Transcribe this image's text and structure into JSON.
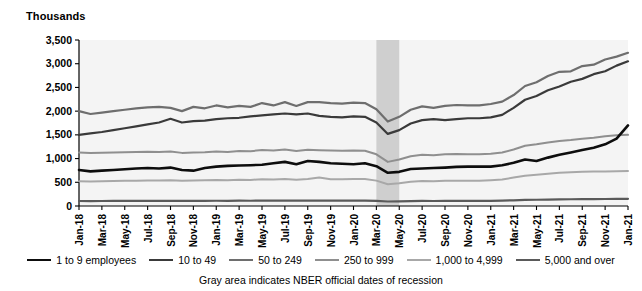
{
  "axis_title": "Thousands",
  "footnote": "Gray area indicates NBER official dates of recession",
  "legend": {
    "items": [
      {
        "label": "1 to 9 employees",
        "color": "#0d0d0d",
        "width": 2.6
      },
      {
        "label": "10 to 49",
        "color": "#3a3a3a",
        "width": 2.2
      },
      {
        "label": "50 to 249",
        "color": "#6e6e6e",
        "width": 2.2
      },
      {
        "label": "250 to 999",
        "color": "#8f8f8f",
        "width": 2.0
      },
      {
        "label": "1,000 to 4,999",
        "color": "#a8a8a8",
        "width": 2.0
      },
      {
        "label": "5,000 and over",
        "color": "#5a5a5a",
        "width": 2.2
      }
    ]
  },
  "chart_data": {
    "type": "line",
    "title": "",
    "xlabel": "",
    "ylabel": "Thousands",
    "ylim": [
      0,
      3500
    ],
    "ytick_step": 500,
    "yticks": [
      0,
      500,
      1000,
      1500,
      2000,
      2500,
      3000,
      3500
    ],
    "ytick_labels": [
      "0",
      "500",
      "1,000",
      "1,500",
      "2,000",
      "2,500",
      "3,000",
      "3,500"
    ],
    "grid": false,
    "legend_position": "bottom",
    "x": [
      "Jan-18",
      "Feb-18",
      "Mar-18",
      "Apr-18",
      "May-18",
      "Jun-18",
      "Jul-18",
      "Aug-18",
      "Sep-18",
      "Oct-18",
      "Nov-18",
      "Dec-18",
      "Jan-19",
      "Feb-19",
      "Mar-19",
      "Apr-19",
      "May-19",
      "Jun-19",
      "Jul-19",
      "Aug-19",
      "Sep-19",
      "Oct-19",
      "Nov-19",
      "Dec-19",
      "Jan-20",
      "Feb-20",
      "Mar-20",
      "Apr-20",
      "May-20",
      "Jun-20",
      "Jul-20",
      "Aug-20",
      "Sep-20",
      "Oct-20",
      "Nov-20",
      "Dec-20",
      "Jan-21",
      "Feb-21",
      "Mar-21",
      "Apr-21",
      "May-21",
      "Jun-21",
      "Jul-21",
      "Aug-21",
      "Sep-21",
      "Oct-21",
      "Nov-21",
      "Dec-21",
      "Jan-22"
    ],
    "xtick_labels": [
      "Jan-18",
      "Mar-18",
      "May-18",
      "Jul-18",
      "Sep-18",
      "Nov-18",
      "Jan-19",
      "Mar-19",
      "May-19",
      "Jul-19",
      "Sep-19",
      "Nov-19",
      "Jan-20",
      "Mar-20",
      "May-20",
      "Jul-20",
      "Sep-20",
      "Nov-20",
      "Jan-21",
      "Mar-21",
      "May-21",
      "Jul-21",
      "Sep-21",
      "Nov-21",
      "Jan-21"
    ],
    "xtick_indices": [
      0,
      2,
      4,
      6,
      8,
      10,
      12,
      14,
      16,
      18,
      20,
      22,
      24,
      26,
      28,
      30,
      32,
      34,
      36,
      38,
      40,
      42,
      44,
      46,
      48
    ],
    "shaded_region": {
      "label": "NBER official dates of recession",
      "from": "Mar-20",
      "to": "May-20",
      "from_index": 26,
      "to_index": 28,
      "color": "#cfcfcf"
    },
    "series": [
      {
        "name": "1 to 9 employees",
        "color": "#0d0d0d",
        "width": 2.6,
        "values": [
          760,
          730,
          745,
          760,
          775,
          790,
          800,
          790,
          810,
          760,
          745,
          800,
          830,
          845,
          855,
          860,
          870,
          900,
          930,
          880,
          950,
          930,
          900,
          890,
          880,
          900,
          840,
          700,
          720,
          780,
          790,
          800,
          810,
          825,
          830,
          830,
          830,
          860,
          910,
          980,
          950,
          1020,
          1080,
          1130,
          1180,
          1230,
          1300,
          1420,
          1700
        ]
      },
      {
        "name": "10 to 49",
        "color": "#3a3a3a",
        "width": 2.2,
        "values": [
          1500,
          1530,
          1560,
          1600,
          1640,
          1680,
          1720,
          1760,
          1840,
          1760,
          1790,
          1800,
          1830,
          1850,
          1860,
          1890,
          1910,
          1930,
          1950,
          1930,
          1950,
          1900,
          1880,
          1870,
          1890,
          1880,
          1760,
          1520,
          1600,
          1740,
          1810,
          1830,
          1810,
          1830,
          1850,
          1850,
          1870,
          1920,
          2070,
          2240,
          2320,
          2440,
          2520,
          2620,
          2680,
          2780,
          2840,
          2960,
          3050
        ]
      },
      {
        "name": "50 to 249",
        "color": "#6e6e6e",
        "width": 2.2,
        "values": [
          2000,
          1940,
          1970,
          2000,
          2030,
          2060,
          2080,
          2090,
          2070,
          2000,
          2090,
          2060,
          2120,
          2080,
          2110,
          2090,
          2170,
          2120,
          2190,
          2110,
          2190,
          2190,
          2170,
          2160,
          2180,
          2170,
          2040,
          1780,
          1880,
          2030,
          2100,
          2070,
          2110,
          2130,
          2120,
          2120,
          2150,
          2200,
          2340,
          2530,
          2610,
          2740,
          2830,
          2840,
          2950,
          2980,
          3090,
          3150,
          3230
        ]
      },
      {
        "name": "250 to 999",
        "color": "#8f8f8f",
        "width": 2.0,
        "values": [
          1130,
          1120,
          1125,
          1130,
          1135,
          1140,
          1145,
          1140,
          1150,
          1120,
          1130,
          1135,
          1150,
          1140,
          1160,
          1155,
          1180,
          1170,
          1190,
          1160,
          1185,
          1175,
          1170,
          1165,
          1170,
          1165,
          1090,
          930,
          980,
          1050,
          1080,
          1070,
          1090,
          1095,
          1090,
          1090,
          1100,
          1130,
          1190,
          1270,
          1300,
          1340,
          1370,
          1390,
          1420,
          1440,
          1470,
          1490,
          1500
        ]
      },
      {
        "name": "1,000 to 4,999",
        "color": "#a8a8a8",
        "width": 2.0,
        "values": [
          520,
          515,
          520,
          525,
          530,
          535,
          540,
          538,
          545,
          530,
          540,
          545,
          550,
          545,
          555,
          550,
          565,
          560,
          570,
          555,
          570,
          600,
          565,
          565,
          570,
          568,
          535,
          460,
          480,
          510,
          525,
          520,
          530,
          535,
          535,
          535,
          545,
          560,
          600,
          640,
          660,
          680,
          700,
          710,
          720,
          725,
          730,
          735,
          740
        ]
      },
      {
        "name": "5,000 and over",
        "color": "#5a5a5a",
        "width": 2.2,
        "values": [
          105,
          104,
          105,
          106,
          107,
          108,
          109,
          108,
          110,
          107,
          109,
          110,
          111,
          110,
          112,
          111,
          114,
          113,
          115,
          112,
          115,
          114,
          114,
          113,
          115,
          114,
          108,
          95,
          98,
          104,
          106,
          105,
          107,
          108,
          108,
          108,
          110,
          113,
          120,
          128,
          132,
          136,
          140,
          142,
          145,
          146,
          148,
          150,
          152
        ]
      }
    ]
  }
}
